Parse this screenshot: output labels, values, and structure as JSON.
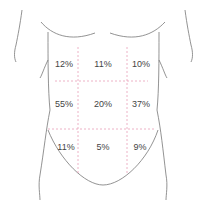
{
  "diagram": {
    "title": "",
    "colors": {
      "outline": "#777777",
      "grid": "#e8a0b8",
      "text": "#444444"
    },
    "regions": [
      {
        "row": 0,
        "col": 0,
        "label": "12%"
      },
      {
        "row": 0,
        "col": 1,
        "label": "11%"
      },
      {
        "row": 0,
        "col": 2,
        "label": "10%"
      },
      {
        "row": 1,
        "col": 0,
        "label": "55%"
      },
      {
        "row": 1,
        "col": 1,
        "label": "20%"
      },
      {
        "row": 1,
        "col": 2,
        "label": "37%"
      },
      {
        "row": 2,
        "col": 0,
        "label": "11%"
      },
      {
        "row": 2,
        "col": 1,
        "label": "5%"
      },
      {
        "row": 2,
        "col": 2,
        "label": "9%"
      }
    ]
  }
}
